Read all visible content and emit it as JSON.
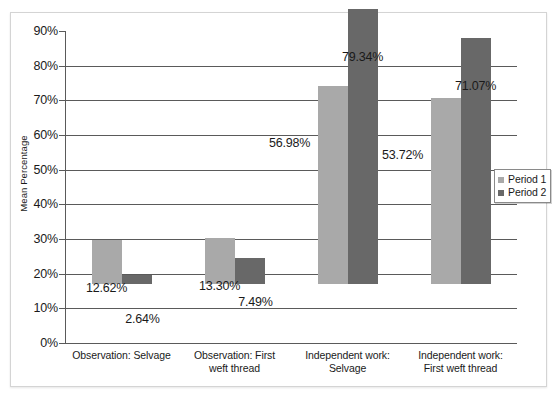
{
  "chart_data": {
    "type": "bar",
    "title": "",
    "xlabel": "",
    "ylabel": "Mean Percentage",
    "ylim": [
      0,
      90
    ],
    "ytick_step": 10,
    "grid": true,
    "legend_position": "right",
    "categories": [
      "Observation: Selvage",
      "Observation: First weft thread",
      "Independent work: Selvage",
      "Independent work: First weft thread"
    ],
    "category_lines": [
      [
        "Observation: Selvage"
      ],
      [
        "Observation: First",
        "weft thread"
      ],
      [
        "Independent work:",
        "Selvage"
      ],
      [
        "Independent work:",
        "First weft thread"
      ]
    ],
    "ytick_labels": [
      "90%",
      "80%",
      "70%",
      "60%",
      "50%",
      "40%",
      "30%",
      "20%",
      "10%",
      "0%"
    ],
    "ytick_values": [
      90,
      80,
      70,
      60,
      50,
      40,
      30,
      20,
      10,
      0
    ],
    "series": [
      {
        "name": "Period 1",
        "color": "#a9a9a9",
        "values": [
          12.62,
          13.3,
          56.98,
          53.72
        ],
        "labels": [
          "12.62%",
          "13.30%",
          "56.98%",
          "53.72%"
        ]
      },
      {
        "name": "Period 2",
        "color": "#686868",
        "values": [
          2.64,
          7.49,
          79.34,
          71.07
        ],
        "labels": [
          "2.64%",
          "7.49%",
          "79.34%",
          "71.07%"
        ]
      }
    ]
  },
  "legend": {
    "items": [
      {
        "label": "Period 1",
        "color": "#a9a9a9"
      },
      {
        "label": "Period 2",
        "color": "#686868"
      }
    ]
  }
}
